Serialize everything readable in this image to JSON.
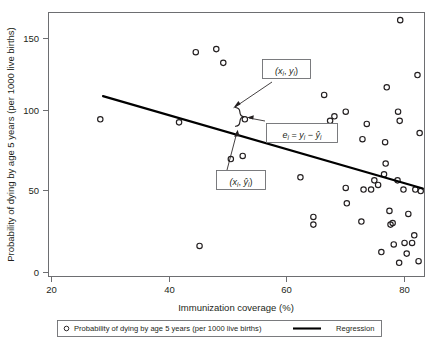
{
  "chart_data": {
    "type": "scatter",
    "title": "",
    "xlabel": "Immunization coverage (%)",
    "ylabel": "Probability of dying by age 5 years (per 1000 live births)",
    "xlim": [
      14.8,
      84.5
    ],
    "ylim": [
      -5,
      168
    ],
    "xticks": [
      20,
      40,
      60,
      80
    ],
    "xtick_labels": [
      "20",
      "40",
      "60",
      "80"
    ],
    "yticks": [
      0,
      50,
      100,
      150
    ],
    "ytick_labels": [
      "0",
      "50",
      "100",
      "150"
    ],
    "grid": false,
    "legend_position": "below-axis",
    "series": [
      {
        "name": "Probability of dying by age 5 years (per 1000 live births)",
        "marker": "open-circle",
        "type": "scatter",
        "points": [
          [
            24.4,
            98
          ],
          [
            39.0,
            96
          ],
          [
            42.1,
            142
          ],
          [
            42.8,
            15
          ],
          [
            45.9,
            144
          ],
          [
            47.2,
            135
          ],
          [
            48.6,
            72
          ],
          [
            50.8,
            74
          ],
          [
            51.2,
            98
          ],
          [
            61.5,
            60
          ],
          [
            63.9,
            34
          ],
          [
            63.9,
            29
          ],
          [
            65.9,
            114
          ],
          [
            67.0,
            97
          ],
          [
            67.8,
            100
          ],
          [
            69.9,
            103
          ],
          [
            69.9,
            53
          ],
          [
            70.1,
            43
          ],
          [
            72.8,
            31
          ],
          [
            73.0,
            85
          ],
          [
            73.2,
            52
          ],
          [
            73.8,
            95
          ],
          [
            74.6,
            52
          ],
          [
            75.2,
            58
          ],
          [
            75.9,
            55
          ],
          [
            76.5,
            11
          ],
          [
            77.0,
            62
          ],
          [
            77.2,
            83
          ],
          [
            77.3,
            69
          ],
          [
            77.5,
            119
          ],
          [
            78.0,
            38
          ],
          [
            78.2,
            29
          ],
          [
            78.6,
            30
          ],
          [
            78.8,
            16
          ],
          [
            79.5,
            58
          ],
          [
            79.6,
            103
          ],
          [
            79.8,
            4
          ],
          [
            79.9,
            97
          ],
          [
            80.0,
            163
          ],
          [
            80.6,
            52
          ],
          [
            80.8,
            17
          ],
          [
            81.2,
            10
          ],
          [
            81.5,
            36
          ],
          [
            82.2,
            17
          ],
          [
            82.6,
            22
          ],
          [
            82.8,
            52
          ],
          [
            83.2,
            127
          ],
          [
            83.4,
            5
          ],
          [
            83.6,
            89
          ],
          [
            83.8,
            51
          ]
        ]
      },
      {
        "name": "Regression",
        "type": "line",
        "x": [
          24.9,
          84.2
        ],
        "y": [
          113.2,
          52.6
        ]
      }
    ],
    "annotations": [
      {
        "name": "observed-point-label",
        "text": "(xi, yi)",
        "box": true,
        "target_point": [
          51.2,
          98
        ]
      },
      {
        "name": "residual-label",
        "text": "ei = yi - ŷi",
        "box": true
      },
      {
        "name": "fitted-point-label",
        "text": "(xi, ŷi)",
        "box": true,
        "target_point": [
          51.2,
          82
        ]
      }
    ]
  },
  "axes": {
    "y_title": "Probability of dying by age 5 years (per 1000 live births)",
    "x_title": "Immunization coverage (%)",
    "ytick_0": "0",
    "ytick_50": "50",
    "ytick_100": "100",
    "ytick_150": "150",
    "xtick_20": "20",
    "xtick_40": "40",
    "xtick_60": "60",
    "xtick_80": "80"
  },
  "legend": {
    "scatter_label": "Probability of dying by age 5 years (per 1000 live births)",
    "line_label": "Regression"
  },
  "annotations": {
    "point_open": "(",
    "point_x": "x",
    "point_i1": "i",
    "point_comma": ", ",
    "point_y": "y",
    "point_i2": "i",
    "point_close": ")",
    "resid_e": "e",
    "resid_i1": "i",
    "resid_eq": " = ",
    "resid_y": "y",
    "resid_i2": "i",
    "resid_minus": " − ",
    "resid_yhat": "ŷ",
    "resid_i3": "i",
    "fit_open": "(",
    "fit_x": "x",
    "fit_i1": "i",
    "fit_comma": ", ",
    "fit_yhat": "ŷ",
    "fit_i2": "i",
    "fit_close": ")"
  },
  "colors": {
    "ink": "#231f20",
    "frame": "#6d6e71",
    "marker": "#231f20",
    "line": "#000000"
  }
}
